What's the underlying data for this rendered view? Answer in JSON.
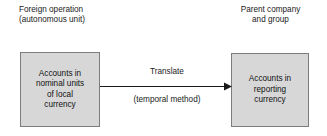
{
  "diagram": {
    "background_color": "#ffffff",
    "box_fill_color": "#d7d7d7",
    "box_border_color": "#7c7c7c",
    "text_color": "#1a1a1a",
    "headers": {
      "left": {
        "line1": "Foreign operation",
        "line2": "(autonomous unit)"
      },
      "right": {
        "line1": "Parent company",
        "line2": "and group"
      }
    },
    "boxes": {
      "left": {
        "line1": "Accounts in",
        "line2": "nominal units",
        "line3": "of local",
        "line4": "currency"
      },
      "right": {
        "line1": "Accounts in",
        "line2": "reporting",
        "line3": "currency"
      }
    },
    "arrow": {
      "label_above": "Translate",
      "label_below": "(temporal method)",
      "direction": "left-to-right",
      "color": "#1a1a1a"
    }
  }
}
